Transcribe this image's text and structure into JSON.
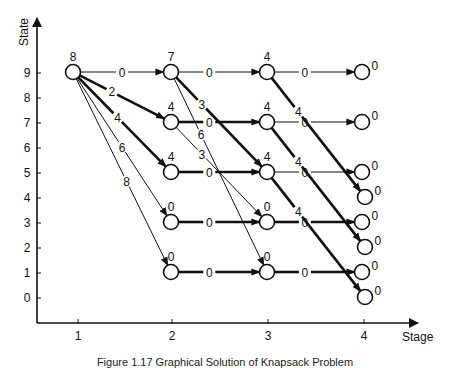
{
  "axes": {
    "y_label": "State",
    "x_label": "Stage",
    "y_ticks": [
      "0",
      "1",
      "2",
      "3",
      "4",
      "5",
      "6",
      "7",
      "8",
      "9"
    ],
    "x_ticks": [
      "1",
      "2",
      "3",
      "4"
    ]
  },
  "caption": "Figure 1.17 Graphical Solution of Knapsack Problem",
  "nodes": [
    {
      "stage": 1,
      "state": 9,
      "value": "8"
    },
    {
      "stage": 2,
      "state": 9,
      "value": "7"
    },
    {
      "stage": 2,
      "state": 7,
      "value": "4"
    },
    {
      "stage": 2,
      "state": 5,
      "value": "4"
    },
    {
      "stage": 2,
      "state": 3,
      "value": "0"
    },
    {
      "stage": 2,
      "state": 1,
      "value": "0"
    },
    {
      "stage": 3,
      "state": 9,
      "value": "4"
    },
    {
      "stage": 3,
      "state": 7,
      "value": "4"
    },
    {
      "stage": 3,
      "state": 5,
      "value": "4"
    },
    {
      "stage": 3,
      "state": 3,
      "value": "0"
    },
    {
      "stage": 3,
      "state": 1,
      "value": "0"
    },
    {
      "stage": 4,
      "state": 9,
      "value": "0"
    },
    {
      "stage": 4,
      "state": 7,
      "value": "0"
    },
    {
      "stage": 4,
      "state": 5,
      "value": "0"
    },
    {
      "stage": 4,
      "state": 4,
      "value": "0"
    },
    {
      "stage": 4,
      "state": 3,
      "value": "0"
    },
    {
      "stage": 4,
      "state": 2,
      "value": "0"
    },
    {
      "stage": 4,
      "state": 1,
      "value": "0"
    },
    {
      "stage": 4,
      "state": 0,
      "value": "0"
    }
  ],
  "edges": [
    {
      "from": [
        1,
        9
      ],
      "to": [
        2,
        9
      ],
      "label": "0",
      "bold": false
    },
    {
      "from": [
        1,
        9
      ],
      "to": [
        2,
        7
      ],
      "label": "2",
      "bold": true
    },
    {
      "from": [
        1,
        9
      ],
      "to": [
        2,
        5
      ],
      "label": "4",
      "bold": true
    },
    {
      "from": [
        1,
        9
      ],
      "to": [
        2,
        3
      ],
      "label": "6",
      "bold": false
    },
    {
      "from": [
        1,
        9
      ],
      "to": [
        2,
        1
      ],
      "label": "8",
      "bold": false
    },
    {
      "from": [
        2,
        9
      ],
      "to": [
        3,
        9
      ],
      "label": "0",
      "bold": false
    },
    {
      "from": [
        2,
        9
      ],
      "to": [
        3,
        5
      ],
      "label": "3",
      "bold": true
    },
    {
      "from": [
        2,
        9
      ],
      "to": [
        3,
        1
      ],
      "label": "6",
      "bold": false
    },
    {
      "from": [
        2,
        7
      ],
      "to": [
        3,
        7
      ],
      "label": "0",
      "bold": true
    },
    {
      "from": [
        2,
        7
      ],
      "to": [
        3,
        3
      ],
      "label": "3",
      "bold": false
    },
    {
      "from": [
        2,
        5
      ],
      "to": [
        3,
        5
      ],
      "label": "0",
      "bold": true
    },
    {
      "from": [
        2,
        3
      ],
      "to": [
        3,
        3
      ],
      "label": "0",
      "bold": true
    },
    {
      "from": [
        2,
        1
      ],
      "to": [
        3,
        1
      ],
      "label": "0",
      "bold": true
    },
    {
      "from": [
        3,
        9
      ],
      "to": [
        4,
        9
      ],
      "label": "0",
      "bold": false
    },
    {
      "from": [
        3,
        9
      ],
      "to": [
        4,
        4
      ],
      "label": "4",
      "bold": true
    },
    {
      "from": [
        3,
        7
      ],
      "to": [
        4,
        7
      ],
      "label": "0",
      "bold": false
    },
    {
      "from": [
        3,
        7
      ],
      "to": [
        4,
        2
      ],
      "label": "4",
      "bold": true
    },
    {
      "from": [
        3,
        5
      ],
      "to": [
        4,
        5
      ],
      "label": "0",
      "bold": false
    },
    {
      "from": [
        3,
        5
      ],
      "to": [
        4,
        0
      ],
      "label": "4",
      "bold": true
    },
    {
      "from": [
        3,
        3
      ],
      "to": [
        4,
        3
      ],
      "label": "0",
      "bold": true
    },
    {
      "from": [
        3,
        1
      ],
      "to": [
        4,
        1
      ],
      "label": "0",
      "bold": true
    }
  ]
}
